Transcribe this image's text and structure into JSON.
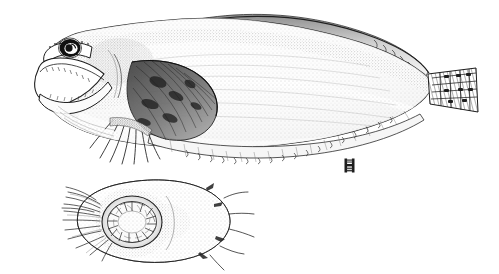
{
  "plate": {
    "background_color": "#ffffff",
    "ink_color": "#1a1a1a",
    "medium": "pen-and-ink stipple drawing",
    "figure_count": 2,
    "texts": []
  },
  "figures": [
    {
      "id": "lateral-view",
      "name": "fish-lateral-view",
      "description": "Lateral view of an elongate tadpole-shaped fish with large head, upturned mouth, dorsal and anal fins continuous to the tail",
      "orientation": "head-left",
      "parts": [
        {
          "name": "head",
          "label": "head"
        },
        {
          "name": "eye",
          "label": "eye"
        },
        {
          "name": "mouth",
          "label": "open mouth with teeth"
        },
        {
          "name": "pectoral-fin",
          "label": "pectoral fin"
        },
        {
          "name": "pelvic-rays",
          "label": "pelvic fin rays"
        },
        {
          "name": "dorsal-fin",
          "label": "dorsal fin"
        },
        {
          "name": "anal-fin",
          "label": "anal fin"
        },
        {
          "name": "caudal-fin",
          "label": "caudal fin"
        }
      ]
    },
    {
      "id": "ventral-view",
      "name": "fish-ventral-view",
      "description": "Ventral view of the same fish showing the circular adhesive sucking disc on the belly",
      "orientation": "head-left",
      "parts": [
        {
          "name": "sucking-disc",
          "label": "sucking disc"
        },
        {
          "name": "disc-segments",
          "label": "radial disc segments"
        },
        {
          "name": "body-outline",
          "label": "rounded body outline"
        },
        {
          "name": "fin-rays",
          "label": "fin rays"
        }
      ]
    }
  ],
  "monogram": {
    "name": "artist-monogram",
    "description": "Small rectangular artist's monogram mark between the two figures",
    "x": 344,
    "y": 158,
    "width": 11,
    "height": 15
  },
  "colors": {
    "background": "#ffffff",
    "ink": "#1a1a1a",
    "mid_tone": "#6a6a6a",
    "light_tone": "#b5b5b5",
    "stipple": "#8c8c8c"
  }
}
